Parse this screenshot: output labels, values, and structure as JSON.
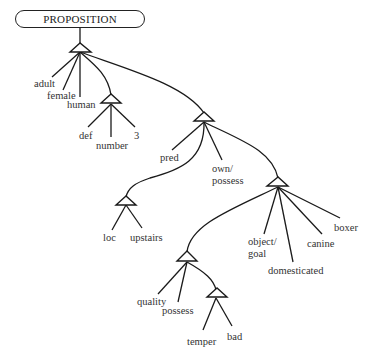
{
  "diagram": {
    "root": {
      "label": "PROPOSITION"
    },
    "nodes": {
      "n1": {
        "children": [
          "adult",
          "female",
          "human",
          "n2",
          "n3"
        ]
      },
      "n2": {
        "children": [
          "def",
          "number",
          "3"
        ]
      },
      "n3": {
        "children": [
          "n4",
          "pred",
          "own/possess",
          "n5"
        ]
      },
      "n4": {
        "children": [
          "loc",
          "upstairs"
        ]
      },
      "n5": {
        "children": [
          "n6",
          "object/goal",
          "domesticated",
          "canine",
          "boxer"
        ]
      },
      "n6": {
        "children": [
          "quality",
          "possess",
          "n7"
        ]
      },
      "n7": {
        "children": [
          "temper",
          "bad"
        ]
      }
    },
    "labels": {
      "adult": "adult",
      "female": "female",
      "human": "human",
      "def": "def",
      "number": "number",
      "three": "3",
      "pred": "pred",
      "own_line1": "own/",
      "own_line2": "possess",
      "loc": "loc",
      "upstairs": "upstairs",
      "object_line1": "object/",
      "object_line2": "goal",
      "domesticated": "domesticated",
      "canine": "canine",
      "boxer": "boxer",
      "quality": "quality",
      "possess": "possess",
      "temper": "temper",
      "bad": "bad"
    },
    "colors": {
      "stroke": "#1a1a1a",
      "text": "#333333",
      "background": "#ffffff"
    }
  }
}
